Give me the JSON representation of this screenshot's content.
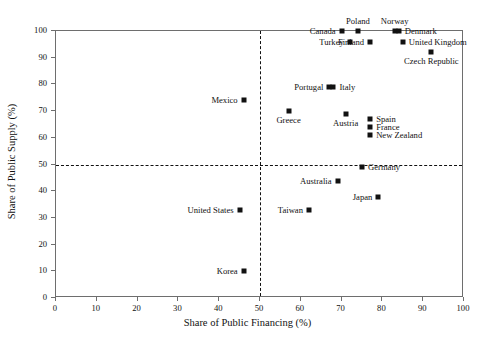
{
  "chart_data": {
    "type": "scatter",
    "title": "",
    "xlabel": "Share of Public Financing (%)",
    "ylabel": "Share of Public Supply (%)",
    "xlim": [
      0,
      100
    ],
    "ylim": [
      0,
      100
    ],
    "xticks": [
      0,
      10,
      20,
      30,
      40,
      50,
      60,
      70,
      80,
      90,
      100
    ],
    "yticks": [
      0,
      10,
      20,
      30,
      40,
      50,
      60,
      70,
      80,
      90,
      100
    ],
    "grid": false,
    "legend": "none",
    "marker_color": "#111111",
    "marker_shape": "square",
    "reference_lines": [
      {
        "axis": "x",
        "value": 50,
        "style": "dashed",
        "color": "#111111"
      },
      {
        "axis": "y",
        "value": 50,
        "style": "dashed",
        "color": "#111111"
      }
    ],
    "points": [
      {
        "label": "Poland",
        "x": 74,
        "y": 100,
        "pos": "t"
      },
      {
        "label": "Norway",
        "x": 83,
        "y": 100,
        "pos": "t"
      },
      {
        "label": "Canada",
        "x": 70,
        "y": 100,
        "pos": "r"
      },
      {
        "label": "Denmark",
        "x": 84,
        "y": 100,
        "pos": "l"
      },
      {
        "label": "Finland",
        "x": 77,
        "y": 96,
        "pos": "r"
      },
      {
        "label": "United Kingdom",
        "x": 85,
        "y": 96,
        "pos": "l"
      },
      {
        "label": "Turkey",
        "x": 72,
        "y": 96,
        "pos": "r"
      },
      {
        "label": "Czech Republic",
        "x": 92,
        "y": 92,
        "pos": "b"
      },
      {
        "label": "Portugal",
        "x": 67,
        "y": 79,
        "pos": "r"
      },
      {
        "label": "Italy",
        "x": 68,
        "y": 79,
        "pos": "l"
      },
      {
        "label": "Mexico",
        "x": 46,
        "y": 74,
        "pos": "r"
      },
      {
        "label": "Greece",
        "x": 57,
        "y": 70,
        "pos": "b"
      },
      {
        "label": "Austria",
        "x": 71,
        "y": 69,
        "pos": "b"
      },
      {
        "label": "Spain",
        "x": 77,
        "y": 67,
        "pos": "l"
      },
      {
        "label": "France",
        "x": 77,
        "y": 64,
        "pos": "l"
      },
      {
        "label": "New Zealand",
        "x": 77,
        "y": 61,
        "pos": "l"
      },
      {
        "label": "Germany",
        "x": 75,
        "y": 49,
        "pos": "l"
      },
      {
        "label": "Australia",
        "x": 69,
        "y": 44,
        "pos": "r"
      },
      {
        "label": "Japan",
        "x": 79,
        "y": 38,
        "pos": "r"
      },
      {
        "label": "United States",
        "x": 45,
        "y": 33,
        "pos": "r"
      },
      {
        "label": "Taiwan",
        "x": 62,
        "y": 33,
        "pos": "r"
      },
      {
        "label": "Korea",
        "x": 46,
        "y": 10,
        "pos": "r"
      }
    ]
  },
  "caption": ""
}
